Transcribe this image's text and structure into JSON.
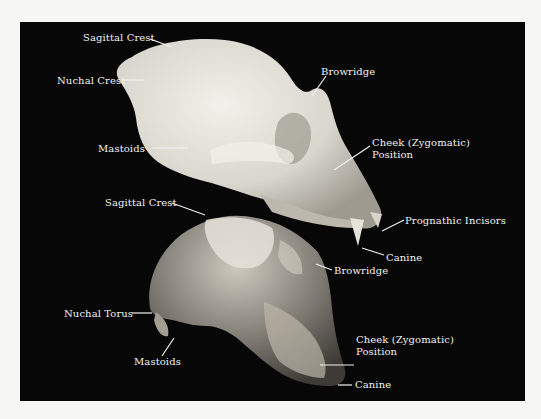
{
  "figure": {
    "colors": {
      "page_background": "#f6f6f4",
      "photo_background": "#070707",
      "label_text": "#f2f2f0",
      "upper_skull": "#e4e2dc",
      "lower_skull": "#8a857c"
    },
    "upper_skull": {
      "labels": [
        {
          "id": "sagittal-crest",
          "text": "Sagittal Crest"
        },
        {
          "id": "nuchal-crest",
          "text": "Nuchal Crest"
        },
        {
          "id": "browridge",
          "text": "Browridge"
        },
        {
          "id": "mastoids",
          "text": "Mastoids"
        },
        {
          "id": "cheek-line1",
          "text": "Cheek (Zygomatic)"
        },
        {
          "id": "cheek-line2",
          "text": "Position"
        },
        {
          "id": "prognathic-incisors",
          "text": "Prognathic Incisors"
        },
        {
          "id": "canine",
          "text": "Canine"
        }
      ]
    },
    "lower_skull": {
      "labels": [
        {
          "id": "sagittal-crest",
          "text": "Sagittal Crest"
        },
        {
          "id": "browridge",
          "text": "Browridge"
        },
        {
          "id": "nuchal-torus",
          "text": "Nuchal Torus"
        },
        {
          "id": "mastoids",
          "text": "Mastoids"
        },
        {
          "id": "cheek-line1",
          "text": "Cheek (Zygomatic)"
        },
        {
          "id": "cheek-line2",
          "text": "Position"
        },
        {
          "id": "canine",
          "text": "Canine"
        }
      ]
    }
  }
}
